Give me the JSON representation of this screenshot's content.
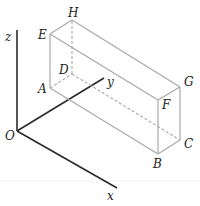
{
  "diagram": {
    "type": "3d-coordinate-cuboid",
    "origin_label": "O",
    "axes": {
      "x": "x",
      "y": "y",
      "z": "z"
    },
    "vertices": {
      "A": "A",
      "B": "B",
      "C": "C",
      "D": "D",
      "E": "E",
      "F": "F",
      "G": "G",
      "H": "H"
    },
    "visible_edges": [
      "AB",
      "BC",
      "CG",
      "GF",
      "FB",
      "AE",
      "EF",
      "EH",
      "HG"
    ],
    "hidden_edges": [
      "AD",
      "DC",
      "DH"
    ]
  }
}
